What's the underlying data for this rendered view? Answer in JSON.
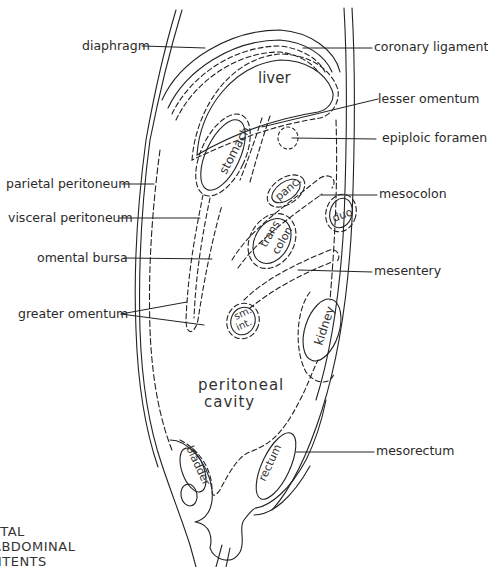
{
  "diagram": {
    "type": "sagittal section of abdominal contents",
    "title_lines": [
      "TTAL",
      "ABDOMINAL",
      "NTENTS"
    ],
    "organs": {
      "liver": "liver",
      "stomach": "stomach",
      "pancreas": "panc.",
      "trans_colon_1": "trans",
      "trans_colon_2": "colon",
      "duodenum": "duo",
      "small_int_1": "sm.",
      "small_int_2": "int.",
      "kidney": "kidney",
      "cavity_1": "peritoneal",
      "cavity_2": "cavity",
      "bladder": "bladder",
      "rectum": "rectum"
    },
    "labels_left": {
      "diaphragm": "diaphragm",
      "parietal_peritoneum": "parietal peritoneum",
      "visceral_peritoneum": "visceral peritoneum",
      "omental_bursa": "omental bursa",
      "greater_omentum": "greater omentum"
    },
    "labels_right": {
      "coronary_ligament": "coronary ligament",
      "lesser_omentum": "lesser omentum",
      "epiploic_foramen": "epiploic foramen",
      "mesocolon": "mesocolon",
      "mesentery": "mesentery",
      "mesorectum": "mesorectum"
    },
    "colors": {
      "line": "#222222",
      "text": "#2a2a2a",
      "background": "#ffffff"
    }
  }
}
